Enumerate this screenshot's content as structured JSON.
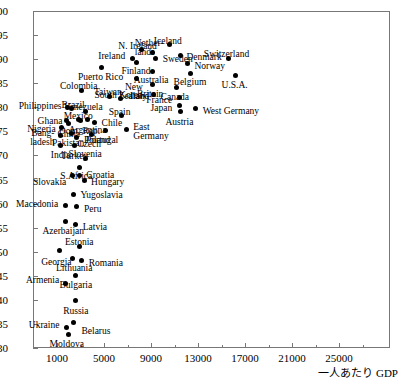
{
  "chart_data": {
    "type": "scatter",
    "title": "",
    "xlabel": "一人あたり GDP",
    "ylabel": "",
    "xlim": [
      0,
      28000
    ],
    "ylim": [
      30,
      100
    ],
    "grid": false,
    "legend": null,
    "x_ticks": [
      1000,
      5000,
      9000,
      13000,
      17000,
      21000,
      25000
    ],
    "x_tick_labels": [
      "1000",
      "5000",
      "9000",
      "13000",
      "17000",
      "21000",
      "25000"
    ],
    "y_ticks": [
      30,
      35,
      40,
      45,
      50,
      55,
      60,
      65,
      70,
      75,
      80,
      85,
      90,
      95,
      100
    ],
    "y_tick_labels": [
      "30",
      "35",
      "40",
      "45",
      "50",
      "55",
      "60",
      "65",
      "70",
      "75",
      "80",
      "85",
      "90",
      "95",
      "100"
    ],
    "points": [
      {
        "label": "Moldova",
        "x": 2000,
        "y": 32.8,
        "lx": -2,
        "ly": 9,
        "align": "c"
      },
      {
        "label": "Belarus",
        "x": 2400,
        "y": 35.4,
        "lx": 8,
        "ly": 9,
        "align": "l"
      },
      {
        "label": "Ukraine",
        "x": 1800,
        "y": 34.3,
        "lx": -7,
        "ly": -2,
        "align": "r"
      },
      {
        "label": "Russia",
        "x": 2600,
        "y": 39.8,
        "lx": 0,
        "ly": 10,
        "align": "c"
      },
      {
        "label": "Armenia",
        "x": 1700,
        "y": 43.4,
        "lx": -6,
        "ly": -3,
        "align": "r"
      },
      {
        "label": "Bulgaria",
        "x": 2600,
        "y": 45.1,
        "lx": 0,
        "ly": 10,
        "align": "c"
      },
      {
        "label": "Lithuania",
        "x": 2300,
        "y": 48.6,
        "lx": 2,
        "ly": 10,
        "align": "c"
      },
      {
        "label": "Romania",
        "x": 3100,
        "y": 48.1,
        "lx": 7,
        "ly": 2,
        "align": "l"
      },
      {
        "label": "Georgia",
        "x": 1200,
        "y": 50.2,
        "lx": -3,
        "ly": 11,
        "align": "c"
      },
      {
        "label": "Estonia",
        "x": 2900,
        "y": 51.1,
        "lx": 0,
        "ly": -4,
        "align": "c"
      },
      {
        "label": "Latvia",
        "x": 2600,
        "y": 55.6,
        "lx": 7,
        "ly": 2,
        "align": "l"
      },
      {
        "label": "Azerbaijan",
        "x": 1700,
        "y": 56.2,
        "lx": -2,
        "ly": 9,
        "align": "c"
      },
      {
        "label": "Peru",
        "x": 2700,
        "y": 59.4,
        "lx": 7,
        "ly": 3,
        "align": "l"
      },
      {
        "label": "Macedonia",
        "x": 1700,
        "y": 59.5,
        "lx": -7,
        "ly": -2,
        "align": "r"
      },
      {
        "label": "Yugoslavia",
        "x": 2400,
        "y": 61.9,
        "lx": 7,
        "ly": 1,
        "align": "l"
      },
      {
        "label": "Hungary",
        "x": 3300,
        "y": 64.8,
        "lx": 7,
        "ly": 2,
        "align": "l"
      },
      {
        "label": "Slovakia",
        "x": 2300,
        "y": 65.9,
        "lx": -6,
        "ly": 7,
        "align": "r"
      },
      {
        "label": "Croatia",
        "x": 2900,
        "y": 65.8,
        "lx": 7,
        "ly": -1,
        "align": "l"
      },
      {
        "label": "S.Africa",
        "x": 2900,
        "y": 67.4,
        "lx": -3,
        "ly": 8,
        "align": "c"
      },
      {
        "label": "India",
        "x": 1300,
        "y": 72.1,
        "lx": 0,
        "ly": 10,
        "align": "c"
      },
      {
        "label": "Turkey",
        "x": 2500,
        "y": 72.0,
        "lx": 0,
        "ly": 10,
        "align": "c"
      },
      {
        "label": "Slovenia",
        "x": 3400,
        "y": 69.4,
        "lx": 0,
        "ly": -4,
        "align": "c"
      },
      {
        "label": "Bangladesh",
        "x": 1300,
        "y": 74.2,
        "lx": -6,
        "ly": -1,
        "align": "r"
      },
      {
        "label": "Nigeria",
        "x": 1400,
        "y": 75.9,
        "lx": -6,
        "ly": 2,
        "align": "r"
      },
      {
        "label": "Pakistan",
        "x": 2200,
        "y": 74.5,
        "lx": -3,
        "ly": 9,
        "align": "c"
      },
      {
        "label": "Poland",
        "x": 2700,
        "y": 73.8,
        "lx": 7,
        "ly": 3,
        "align": "l"
      },
      {
        "label": "Czech",
        "x": 3900,
        "y": 74.3,
        "lx": -2,
        "ly": 9,
        "align": "c"
      },
      {
        "label": "Ghana",
        "x": 1800,
        "y": 77.3,
        "lx": -4,
        "ly": 1,
        "align": "r"
      },
      {
        "label": "China",
        "x": 2000,
        "y": 76.6,
        "lx": 0,
        "ly": 10,
        "align": "c"
      },
      {
        "label": "Philippines",
        "x": 1900,
        "y": 79.9,
        "lx": -6,
        "ly": -2,
        "align": "r"
      },
      {
        "label": "Brazil",
        "x": 2200,
        "y": 79.7,
        "lx": 2,
        "ly": -4,
        "align": "c"
      },
      {
        "label": "Mexico",
        "x": 2800,
        "y": 77.4,
        "lx": 0,
        "ly": -4,
        "align": "c"
      },
      {
        "label": "Dom. Rep.",
        "x": 3000,
        "y": 77.2,
        "lx": -1,
        "ly": 10,
        "align": "c"
      },
      {
        "label": "Argentina",
        "x": 3600,
        "y": 77.4,
        "lx": 0,
        "ly": 10,
        "align": "c"
      },
      {
        "label": "Chile",
        "x": 4200,
        "y": 76.9,
        "lx": 7,
        "ly": 1,
        "align": "l"
      },
      {
        "label": "Colombia",
        "x": 3100,
        "y": 83.5,
        "lx": -3,
        "ly": -4,
        "align": "c"
      },
      {
        "label": "Venezuela",
        "x": 3400,
        "y": 79.2,
        "lx": -2,
        "ly": -4,
        "align": "c"
      },
      {
        "label": "Portugal",
        "x": 5100,
        "y": 75.1,
        "lx": -3,
        "ly": 9,
        "align": "c"
      },
      {
        "label": "Puerto Rico",
        "x": 4800,
        "y": 88.2,
        "lx": -1,
        "ly": 9,
        "align": "c"
      },
      {
        "label": "Taiwan",
        "x": 5500,
        "y": 82.3,
        "lx": -2,
        "ly": -4,
        "align": "c"
      },
      {
        "label": "South Korea",
        "x": 6400,
        "y": 81.8,
        "lx": -2,
        "ly": -4,
        "align": "c"
      },
      {
        "label": "Spain",
        "x": 6500,
        "y": 78.2,
        "lx": -2,
        "ly": -4,
        "align": "c"
      },
      {
        "label": "East Germany",
        "x": 6900,
        "y": 75.4,
        "lx": 7,
        "ly": -1,
        "align": "l"
      },
      {
        "label": "Ireland",
        "x": 7400,
        "y": 90.2,
        "lx": -7,
        "ly": -2,
        "align": "r"
      },
      {
        "label": "N. Ireland",
        "x": 8200,
        "y": 92.0,
        "lx": -4,
        "ly": -4,
        "align": "c"
      },
      {
        "label": "Finland",
        "x": 7800,
        "y": 89.4,
        "lx": -1,
        "ly": 9,
        "align": "c"
      },
      {
        "label": "New Zealand",
        "x": 7800,
        "y": 86.0,
        "lx": -3,
        "ly": 10,
        "align": "c"
      },
      {
        "label": "Netherlands",
        "x": 9100,
        "y": 91.3,
        "lx": -3,
        "ly": -9,
        "align": "c"
      },
      {
        "label": "Sweden",
        "x": 9400,
        "y": 90.2,
        "lx": 7,
        "ly": 1,
        "align": "l"
      },
      {
        "label": "Australia",
        "x": 9100,
        "y": 87.5,
        "lx": -1,
        "ly": 9,
        "align": "c"
      },
      {
        "label": "Britain",
        "x": 9100,
        "y": 84.7,
        "lx": -2,
        "ly": 9,
        "align": "c"
      },
      {
        "label": "Italy",
        "x": 9200,
        "y": 82.6,
        "lx": -6,
        "ly": 1,
        "align": "r"
      },
      {
        "label": "Iceland",
        "x": 10600,
        "y": 93.0,
        "lx": -2,
        "ly": -4,
        "align": "c"
      },
      {
        "label": "Denmark",
        "x": 11500,
        "y": 90.7,
        "lx": 6,
        "ly": 1,
        "align": "l"
      },
      {
        "label": "Norway",
        "x": 12100,
        "y": 89.0,
        "lx": 7,
        "ly": 2,
        "align": "l"
      },
      {
        "label": "Belgium",
        "x": 12400,
        "y": 87.1,
        "lx": -1,
        "ly": 9,
        "align": "c"
      },
      {
        "label": "Canada",
        "x": 11200,
        "y": 84.1,
        "lx": -2,
        "ly": 9,
        "align": "c"
      },
      {
        "label": "France",
        "x": 11400,
        "y": 82.0,
        "lx": -7,
        "ly": 2,
        "align": "r"
      },
      {
        "label": "Japan",
        "x": 11400,
        "y": 80.4,
        "lx": -7,
        "ly": 3,
        "align": "r"
      },
      {
        "label": "Austria",
        "x": 11500,
        "y": 79.1,
        "lx": -1,
        "ly": 10,
        "align": "c"
      },
      {
        "label": "West Germany",
        "x": 12800,
        "y": 79.7,
        "lx": 7,
        "ly": 2,
        "align": "l"
      },
      {
        "label": "Switzerland",
        "x": 15600,
        "y": 90.2,
        "lx": -2,
        "ly": -4,
        "align": "c"
      },
      {
        "label": "U.S.A.",
        "x": 16200,
        "y": 86.6,
        "lx": -1,
        "ly": 9,
        "align": "c"
      }
    ]
  },
  "axes": {
    "x_title": "一人あたり GDP",
    "y_title": ""
  }
}
